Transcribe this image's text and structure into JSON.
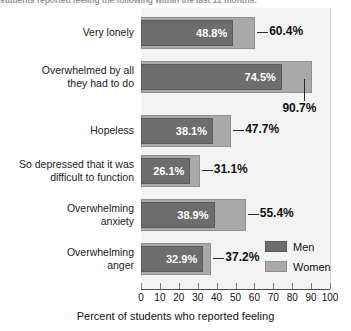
{
  "headline": "students reported feeling the following within the last 12 months:",
  "chart_data": {
    "type": "bar",
    "orientation": "horizontal",
    "title": "",
    "xlabel": "Percent of students who reported feeling",
    "ylabel": "",
    "xlim": [
      0,
      100
    ],
    "xticks": [
      0,
      10,
      20,
      30,
      40,
      50,
      60,
      70,
      80,
      90,
      100
    ],
    "xtick_labels": [
      "0",
      "10",
      "20",
      "30",
      "40",
      "50",
      "60",
      "70",
      "80",
      "90",
      "100"
    ],
    "grid": false,
    "legend_position": "middle-right",
    "categories": [
      "Very lonely",
      "Overwhelmed by all they had to do",
      "Hopeless",
      "So depressed that it was difficult to function",
      "Overwhelming anxiety",
      "Overwhelming anger"
    ],
    "series": [
      {
        "name": "Men",
        "color": "#6d6d6d",
        "values": [
          48.8,
          74.5,
          38.1,
          26.1,
          38.9,
          32.9
        ],
        "labels": [
          "48.8%",
          "74.5%",
          "38.1%",
          "26.1%",
          "38.9%",
          "32.9%"
        ]
      },
      {
        "name": "Women",
        "color": "#a9a9a9",
        "values": [
          60.4,
          90.7,
          47.7,
          31.1,
          55.4,
          37.2
        ],
        "labels": [
          "60.4%",
          "90.7%",
          "47.7%",
          "31.1%",
          "55.4%",
          "37.2%"
        ]
      }
    ]
  },
  "rows": [
    {
      "category": "Very lonely",
      "category_line1": "Very lonely",
      "category_line2": "",
      "men_label": "48.8%",
      "women_label": "60.4%",
      "men_value": 48.8,
      "women_value": 60.4
    },
    {
      "category": "Overwhelmed by all they had to do",
      "category_line1": "Overwhelmed by all",
      "category_line2": "they had to do",
      "men_label": "74.5%",
      "women_label": "90.7%",
      "men_value": 74.5,
      "women_value": 90.7
    },
    {
      "category": "Hopeless",
      "category_line1": "Hopeless",
      "category_line2": "",
      "men_label": "38.1%",
      "women_label": "47.7%",
      "men_value": 38.1,
      "women_value": 47.7
    },
    {
      "category": "So depressed that it was difficult to function",
      "category_line1": "So depressed that it was",
      "category_line2": "difficult to function",
      "men_label": "26.1%",
      "women_label": "31.1%",
      "men_value": 26.1,
      "women_value": 31.1
    },
    {
      "category": "Overwhelming anxiety",
      "category_line1": "Overwhelming",
      "category_line2": "anxiety",
      "men_label": "38.9%",
      "women_label": "55.4%",
      "men_value": 38.9,
      "women_value": 55.4
    },
    {
      "category": "Overwhelming anger",
      "category_line1": "Overwhelming",
      "category_line2": "anger",
      "men_label": "32.9%",
      "women_label": "37.2%",
      "men_value": 32.9,
      "women_value": 37.2
    }
  ],
  "legend": {
    "men": "Men",
    "women": "Women"
  },
  "axis": {
    "title": "Percent of students who reported feeling",
    "ticks": [
      "0",
      "10",
      "20",
      "30",
      "40",
      "50",
      "60",
      "70",
      "80",
      "90",
      "100"
    ]
  }
}
